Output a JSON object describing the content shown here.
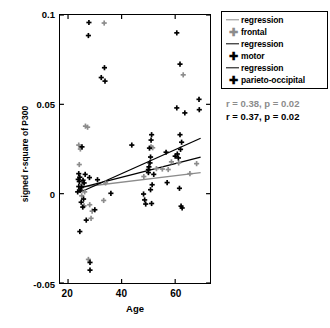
{
  "chart_data": {
    "type": "scatter",
    "title": "",
    "xlabel": "Age",
    "ylabel": "signed r-square of P300",
    "xlim": [
      17,
      73
    ],
    "ylim": [
      -0.05,
      0.1
    ],
    "xticks": [
      20,
      40,
      60
    ],
    "xtick_labels": [
      "20",
      "40",
      "60"
    ],
    "yticks": [
      -0.05,
      0,
      0.05,
      0.1
    ],
    "ytick_labels": [
      "-0.05",
      "0",
      "0.05",
      "0.1"
    ],
    "grid": false,
    "legend_position": "outside-top-right",
    "colors": {
      "frontal": "#8c8c8c",
      "motor": "#000000",
      "parieto_occipital": "#000000",
      "frontal_regression": "#8c8c8c",
      "motor_regression": "#000000",
      "parieto_regression": "#000000",
      "axis": "#000000",
      "background": "#ffffff"
    },
    "series": [
      {
        "name": "frontal",
        "marker": "plus",
        "color": "#8c8c8c",
        "points": [
          [
            33.5,
            0.0955
          ],
          [
            26.5,
            0.0378
          ],
          [
            27.3,
            0.0372
          ],
          [
            24.0,
            0.0272
          ],
          [
            24.6,
            0.025
          ],
          [
            24.2,
            0.0163
          ],
          [
            63.0,
            0.0665
          ],
          [
            51.0,
            0.0262
          ],
          [
            51.6,
            0.0257
          ],
          [
            58.6,
            0.0178
          ],
          [
            61.3,
            0.0172
          ],
          [
            68.0,
            0.0168
          ],
          [
            53.0,
            0.014
          ],
          [
            55.2,
            0.0138
          ],
          [
            57.4,
            0.0135
          ],
          [
            65.5,
            0.0112
          ],
          [
            48.3,
            0.0096
          ],
          [
            34.0,
            0.006
          ],
          [
            25.4,
            0.0052
          ],
          [
            24.8,
            0.0028
          ],
          [
            26.2,
            0.001
          ],
          [
            25.1,
            -0.0012
          ],
          [
            33.3,
            -0.0038
          ],
          [
            28.1,
            -0.0062
          ],
          [
            26.0,
            -0.0068
          ],
          [
            29.0,
            -0.0098
          ],
          [
            28.6,
            -0.0138
          ],
          [
            27.6,
            -0.0368
          ]
        ]
      },
      {
        "name": "motor",
        "marker": "plus",
        "color": "#000000",
        "points": [
          [
            27.8,
            0.0958
          ],
          [
            27.6,
            0.0885
          ],
          [
            60.6,
            0.09
          ],
          [
            33.6,
            0.0705
          ],
          [
            32.4,
            0.065
          ],
          [
            33.8,
            0.063
          ],
          [
            61.8,
            0.0725
          ],
          [
            68.9,
            0.0528
          ],
          [
            60.6,
            0.048
          ],
          [
            69.0,
            0.047
          ],
          [
            63.6,
            0.0452
          ],
          [
            25.2,
            0.0262
          ],
          [
            51.2,
            0.033
          ],
          [
            61.8,
            0.033
          ],
          [
            43.8,
            0.0272
          ],
          [
            51.0,
            0.03
          ],
          [
            50.4,
            0.0255
          ],
          [
            62.4,
            0.0288
          ],
          [
            56.6,
            0.0232
          ],
          [
            60.8,
            0.0222
          ],
          [
            50.8,
            0.0205
          ],
          [
            61.2,
            0.02
          ],
          [
            50.6,
            0.0172
          ],
          [
            50.2,
            0.015
          ],
          [
            24.0,
            0.0112
          ],
          [
            24.4,
            0.0092
          ],
          [
            23.8,
            0.008
          ],
          [
            25.6,
            0.0075
          ],
          [
            24.2,
            0.0068
          ],
          [
            26.4,
            0.0108
          ],
          [
            31.0,
            0.0078
          ],
          [
            50.0,
            0.0118
          ],
          [
            57.0,
            0.0062
          ],
          [
            51.4,
            0.005
          ],
          [
            25.0,
            0.0038
          ],
          [
            24.5,
            0.002
          ],
          [
            23.6,
            0.001
          ],
          [
            36.0,
            0.0002
          ],
          [
            48.2,
            -0.0002
          ],
          [
            50.8,
            0.0022
          ],
          [
            61.6,
            0.003
          ],
          [
            25.8,
            -0.003
          ],
          [
            24.9,
            -0.0048
          ],
          [
            48.6,
            -0.0035
          ],
          [
            49.0,
            -0.0058
          ],
          [
            51.2,
            -0.0055
          ],
          [
            62.2,
            -0.007
          ],
          [
            62.6,
            -0.008
          ],
          [
            25.5,
            -0.0075
          ],
          [
            30.0,
            -0.009
          ],
          [
            26.8,
            -0.0148
          ],
          [
            24.4,
            -0.0212
          ],
          [
            28.2,
            -0.0385
          ],
          [
            28.2,
            -0.0428
          ]
        ]
      },
      {
        "name": "parieto-occipital",
        "marker": "plus",
        "color": "#000000",
        "points": [
          [
            28.0,
            0.009
          ],
          [
            26.0,
            0.006
          ],
          [
            24.0,
            0.004
          ],
          [
            50.0,
            0.0135
          ],
          [
            60.0,
            0.021
          ],
          [
            52.0,
            0.0108
          ],
          [
            62.0,
            0.0248
          ]
        ]
      }
    ],
    "regression_lines": [
      {
        "name": "frontal regression",
        "color": "#8c8c8c",
        "x_start": 24.5,
        "y_start": 0.0036,
        "x_end": 69.5,
        "y_end": 0.0118
      },
      {
        "name": "motor regression",
        "color": "#000000",
        "x_start": 24.5,
        "y_start": 0.0032,
        "x_end": 69.5,
        "y_end": 0.0205
      },
      {
        "name": "parieto-occipital regression",
        "color": "#000000",
        "x_start": 24.5,
        "y_start": 0.0008,
        "x_end": 69.5,
        "y_end": 0.031
      }
    ],
    "annotations": [
      {
        "text": "r = 0.38, p = 0.02",
        "color": "#8c8c8c",
        "bold": true
      },
      {
        "text": "r = 0.37, p = 0.02",
        "color": "#000000",
        "bold": true
      }
    ]
  },
  "legend": {
    "entries": [
      {
        "label": "regression",
        "symbol": "line",
        "color": "#8c8c8c"
      },
      {
        "label": "frontal",
        "symbol": "plus",
        "color": "#8c8c8c"
      },
      {
        "label": "regression",
        "symbol": "line",
        "color": "#000000"
      },
      {
        "label": "motor",
        "symbol": "plus",
        "color": "#000000"
      },
      {
        "label": "regression",
        "symbol": "line",
        "color": "#000000"
      },
      {
        "label": "parieto-occipital",
        "symbol": "plus",
        "color": "#000000"
      }
    ]
  },
  "stats": {
    "line1": "r = 0.38, p = 0.02",
    "line2": "r = 0.37, p = 0.02"
  }
}
